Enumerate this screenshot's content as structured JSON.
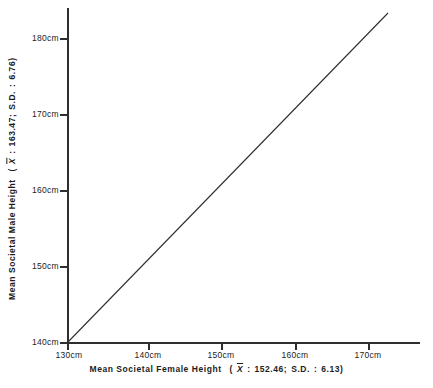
{
  "chart_data": {
    "type": "line",
    "title": "",
    "xlabel": "Mean Societal Female Height   ( X̄ : 152.46; S.D. : 6.13)",
    "ylabel": "Mean Societal Male Height  ( X̄ : 163.47; S.D. : 6.76)",
    "xlabel_parts": {
      "name": "Mean  Societal  Female Height",
      "mean_symbol": "X",
      "mean_sep": ":",
      "mean_value": "152.46;",
      "sd_label": "S.D.",
      "sd_sep": ":",
      "sd_value": "6.13)",
      "open_paren": "("
    },
    "ylabel_parts": {
      "name": "Mean  Societal  Male  Height",
      "mean_symbol": "X",
      "mean_sep": ":",
      "mean_value": "163.47;",
      "sd_label": "S.D.",
      "sd_sep": ":",
      "sd_value": "6.76)",
      "open_paren": "("
    },
    "x_unit": "cm",
    "y_unit": "cm",
    "xlim": [
      130,
      173.5
    ],
    "ylim": [
      140,
      183.5
    ],
    "xticks": [
      130,
      140,
      150,
      160,
      170
    ],
    "yticks": [
      140,
      150,
      160,
      170,
      180
    ],
    "xticklabels": [
      "130cm",
      "140cm",
      "150cm",
      "160cm",
      "170cm"
    ],
    "yticklabels": [
      "140cm",
      "150cm",
      "160cm",
      "170cm",
      "180cm"
    ],
    "grid": false,
    "legend": "none",
    "series": [
      {
        "name": "regression-line",
        "color": "#2e2e2e",
        "x": [
          130,
          173.5
        ],
        "y": [
          140,
          183.5
        ]
      }
    ],
    "statistics": {
      "female_mean": 152.46,
      "female_sd": 6.13,
      "male_mean": 163.47,
      "male_sd": 6.76
    },
    "colors": {
      "axis": "#2e2e2e",
      "line": "#2e2e2e",
      "text": "#1c1c1c",
      "background": "#ffffff"
    }
  }
}
